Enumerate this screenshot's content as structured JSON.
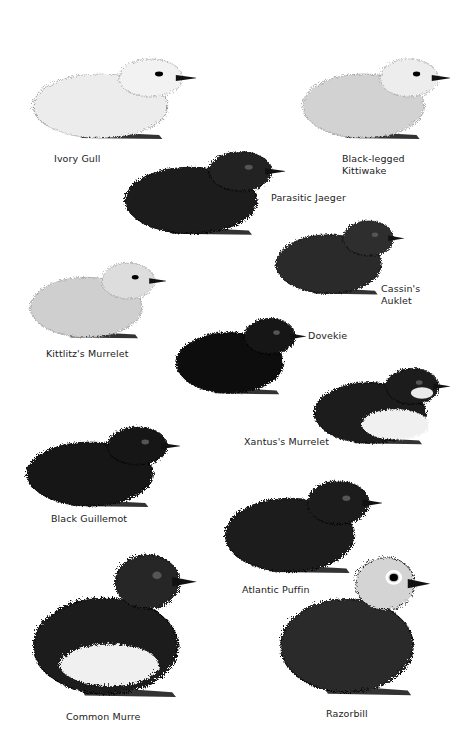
{
  "plate": {
    "background": "#ffffff",
    "birds": [
      {
        "name": "Ivory Gull",
        "tone": "white",
        "body": "#ececec",
        "head": "#f2f2f2",
        "x": 28,
        "y": 45,
        "w": 168,
        "h": 100,
        "label_x": 54,
        "label_y": 153
      },
      {
        "name": "Black-legged\nKittiwake",
        "tone": "grey",
        "body": "#d2d2d2",
        "head": "#ededed",
        "x": 298,
        "y": 45,
        "w": 152,
        "h": 100,
        "label_x": 342,
        "label_y": 153
      },
      {
        "name": "Parasitic Jaeger",
        "tone": "black",
        "body": "#1c1c1c",
        "head": "#222222",
        "x": 120,
        "y": 137,
        "w": 165,
        "h": 104,
        "label_x": 271,
        "label_y": 192
      },
      {
        "name": "Cassin's\nAuklet",
        "tone": "dark-grey",
        "body": "#2b2b2b",
        "head": "#2e2e2e",
        "x": 272,
        "y": 208,
        "w": 132,
        "h": 92,
        "label_x": 381,
        "label_y": 283
      },
      {
        "name": "Kittlitz's Murrelet",
        "tone": "speckled",
        "body": "#cfcfcf",
        "head": "#dddddd",
        "x": 26,
        "y": 250,
        "w": 140,
        "h": 94,
        "label_x": 46,
        "label_y": 348
      },
      {
        "name": "Dovekie",
        "tone": "black",
        "body": "#111111",
        "head": "#141414",
        "x": 172,
        "y": 305,
        "w": 134,
        "h": 95,
        "label_x": 308,
        "label_y": 330
      },
      {
        "name": "Xantus's Murrelet",
        "tone": "bicolor",
        "body": "#1a1a1a",
        "head": "#1a1a1a",
        "x": 310,
        "y": 355,
        "w": 140,
        "h": 95,
        "label_x": 244,
        "label_y": 436
      },
      {
        "name": "Black Guillemot",
        "tone": "black",
        "body": "#141414",
        "head": "#151515",
        "x": 22,
        "y": 413,
        "w": 158,
        "h": 100,
        "label_x": 51,
        "label_y": 513
      },
      {
        "name": "Atlantic Puffin",
        "tone": "black",
        "body": "#1c1c1c",
        "head": "#1d1d1d",
        "x": 220,
        "y": 465,
        "w": 162,
        "h": 115,
        "label_x": 242,
        "label_y": 584
      },
      {
        "name": "Common Murre",
        "tone": "bicolor",
        "body": "#1e1e1e",
        "head": "#262626",
        "x": 24,
        "y": 545,
        "w": 190,
        "h": 160,
        "label_x": 66,
        "label_y": 711
      },
      {
        "name": "Razorbill",
        "tone": "grey-head",
        "body": "#2a2a2a",
        "head": "#d4d4d4",
        "x": 272,
        "y": 548,
        "w": 174,
        "h": 155,
        "label_x": 326,
        "label_y": 708
      }
    ]
  }
}
